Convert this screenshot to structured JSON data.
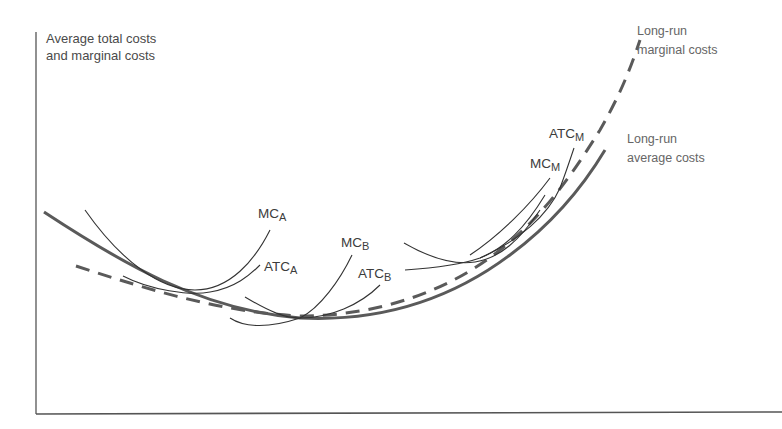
{
  "diagram": {
    "y_axis_label_line1": "Average total costs",
    "y_axis_label_line2": "and marginal costs",
    "x_axis_label": "",
    "long_run_marginal": {
      "line1": "Long-run",
      "line2": "marginal costs"
    },
    "long_run_average": {
      "line1": "Long-run",
      "line2": "average costs"
    },
    "plant_labels": {
      "mc_a": {
        "main": "MC",
        "sub": "A"
      },
      "atc_a": {
        "main": "ATC",
        "sub": "A"
      },
      "mc_b": {
        "main": "MC",
        "sub": "B"
      },
      "atc_b": {
        "main": "ATC",
        "sub": "B"
      },
      "mc_m": {
        "main": "MC",
        "sub": "M"
      },
      "atc_m": {
        "main": "ATC",
        "sub": "M"
      }
    },
    "colors": {
      "axis": "#555555",
      "long_run_curves": "#5a5a5a",
      "short_run_curves": "#333333",
      "text": "#4a4a4a"
    }
  }
}
